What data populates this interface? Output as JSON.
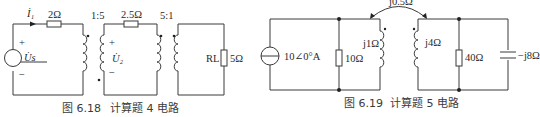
{
  "figure_6_18": {
    "caption_num": "图 6.18",
    "caption_text": "计算题 4 电路",
    "current_label": "İ₁",
    "r1": "2Ω",
    "ratio1": "1:5",
    "r2": "2.5Ω",
    "ratio2": "5:1",
    "source_label": "U̇s",
    "plus": "+",
    "minus": "−",
    "u2_label": "U̇₂",
    "load_name": "RL",
    "load_value": "5Ω"
  },
  "figure_6_19": {
    "caption_num": "图 6.19",
    "caption_text": "计算题 5 电路",
    "source_value": "10∠0°A",
    "r1": "10Ω",
    "l1": "j1Ω",
    "mutual": "j0.5Ω",
    "l2": "j4Ω",
    "r2": "40Ω",
    "c": "−j8Ω"
  }
}
